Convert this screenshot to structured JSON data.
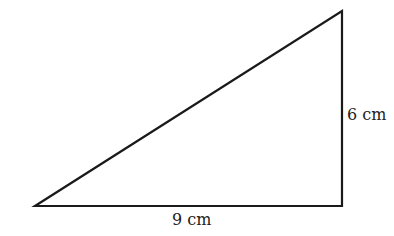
{
  "diagram": {
    "type": "right-triangle",
    "stroke_color": "#1a1a1a",
    "vertices": {
      "bottom_left": [
        35,
        206
      ],
      "bottom_right": [
        342,
        206
      ],
      "top_right": [
        342,
        11
      ]
    },
    "labels": {
      "base": "9 cm",
      "height": "6 cm"
    }
  }
}
